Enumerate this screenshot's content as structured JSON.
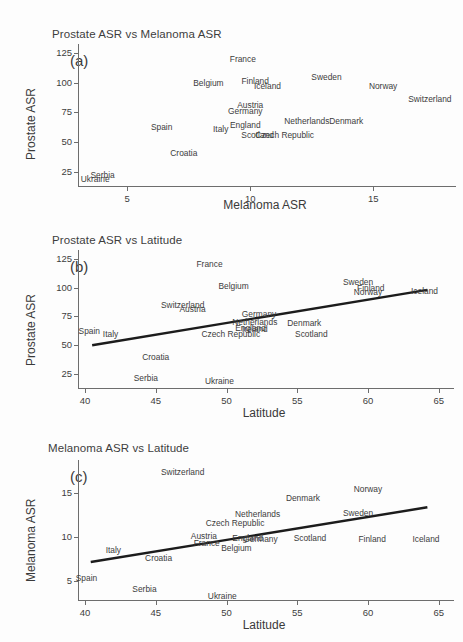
{
  "figure": {
    "background": "#fdfdfd",
    "text_color": "#3c3c3c",
    "line_color": "#1c1c1c"
  },
  "chart_data": [
    {
      "type": "scatter",
      "panel_tag": "(a)",
      "title": "Prostate ASR vs Melanoma ASR",
      "xlabel": "Melanoma ASR",
      "ylabel": "Prostate ASR",
      "xlim": [
        3.0,
        18.2
      ],
      "ylim": [
        13,
        129
      ],
      "xticks": [
        5,
        10,
        15
      ],
      "yticks": [
        25,
        50,
        75,
        100,
        125
      ],
      "grid": false,
      "legend": "none",
      "trendline": null,
      "points": [
        {
          "label": "France",
          "x": 9.7,
          "y": 120
        },
        {
          "label": "Belgium",
          "x": 8.3,
          "y": 100
        },
        {
          "label": "Finland",
          "x": 10.2,
          "y": 101
        },
        {
          "label": "Iceland",
          "x": 10.7,
          "y": 97
        },
        {
          "label": "Sweden",
          "x": 13.1,
          "y": 105
        },
        {
          "label": "Norway",
          "x": 15.4,
          "y": 97
        },
        {
          "label": "Switzerland",
          "x": 17.3,
          "y": 86
        },
        {
          "label": "Austria",
          "x": 10.0,
          "y": 81
        },
        {
          "label": "Germany",
          "x": 9.8,
          "y": 76
        },
        {
          "label": "Netherlands",
          "x": 12.3,
          "y": 68
        },
        {
          "label": "Denmark",
          "x": 13.9,
          "y": 68
        },
        {
          "label": "Spain",
          "x": 6.4,
          "y": 63
        },
        {
          "label": "Italy",
          "x": 8.8,
          "y": 61
        },
        {
          "label": "England",
          "x": 9.8,
          "y": 64
        },
        {
          "label": "Scotland",
          "x": 10.3,
          "y": 56
        },
        {
          "label": "Czech Republic",
          "x": 11.4,
          "y": 56
        },
        {
          "label": "Croatia",
          "x": 7.3,
          "y": 41
        },
        {
          "label": "Serbia",
          "x": 4.0,
          "y": 22
        },
        {
          "label": "Ukraine",
          "x": 3.7,
          "y": 19
        }
      ]
    },
    {
      "type": "scatter",
      "panel_tag": "(b)",
      "title": "Prostate ASR vs Latitude",
      "xlabel": "Latitude",
      "ylabel": "Prostate ASR",
      "xlim": [
        39.5,
        65.8
      ],
      "ylim": [
        13,
        129
      ],
      "xticks": [
        40,
        45,
        50,
        55,
        60,
        65
      ],
      "yticks": [
        25,
        50,
        75,
        100,
        125
      ],
      "grid": false,
      "legend": "none",
      "trendline": {
        "x0": 40.5,
        "y0": 50,
        "x1": 64.2,
        "y1": 98
      },
      "points": [
        {
          "label": "France",
          "x": 48.8,
          "y": 120
        },
        {
          "label": "Belgium",
          "x": 50.5,
          "y": 101
        },
        {
          "label": "Sweden",
          "x": 59.3,
          "y": 105
        },
        {
          "label": "Finland",
          "x": 60.2,
          "y": 100
        },
        {
          "label": "Norway",
          "x": 60.0,
          "y": 96
        },
        {
          "label": "Iceland",
          "x": 64.0,
          "y": 97
        },
        {
          "label": "Switzerland",
          "x": 46.9,
          "y": 85
        },
        {
          "label": "Austria",
          "x": 47.6,
          "y": 81
        },
        {
          "label": "Germany",
          "x": 52.3,
          "y": 77
        },
        {
          "label": "Netherlands",
          "x": 52.0,
          "y": 70
        },
        {
          "label": "England",
          "x": 51.7,
          "y": 65
        },
        {
          "label": "Ireland",
          "x": 52.0,
          "y": 64
        },
        {
          "label": "Denmark",
          "x": 55.5,
          "y": 69
        },
        {
          "label": "Scotland",
          "x": 56.0,
          "y": 60
        },
        {
          "label": "Czech Republic",
          "x": 50.3,
          "y": 60
        },
        {
          "label": "Spain",
          "x": 40.3,
          "y": 62
        },
        {
          "label": "Italy",
          "x": 41.8,
          "y": 60
        },
        {
          "label": "Croatia",
          "x": 45.0,
          "y": 40
        },
        {
          "label": "Serbia",
          "x": 44.3,
          "y": 22
        },
        {
          "label": "Ukraine",
          "x": 49.5,
          "y": 19
        }
      ]
    },
    {
      "type": "scatter",
      "panel_tag": "(c)",
      "title": "Melanoma ASR vs Latitude",
      "xlabel": "Latitude",
      "ylabel": "Melanoma ASR",
      "xlim": [
        39.5,
        65.8
      ],
      "ylim": [
        2.9,
        18.3
      ],
      "xticks": [
        40,
        45,
        50,
        55,
        60,
        65
      ],
      "yticks": [
        5,
        10,
        15
      ],
      "grid": false,
      "legend": "none",
      "trendline": {
        "x0": 40.4,
        "y0": 7.2,
        "x1": 64.2,
        "y1": 13.4
      },
      "points": [
        {
          "label": "Switzerland",
          "x": 46.9,
          "y": 17.4
        },
        {
          "label": "Norway",
          "x": 60.0,
          "y": 15.5
        },
        {
          "label": "Denmark",
          "x": 55.4,
          "y": 14.5
        },
        {
          "label": "Netherlands",
          "x": 52.2,
          "y": 12.6
        },
        {
          "label": "Sweden",
          "x": 59.3,
          "y": 12.7
        },
        {
          "label": "Czech Republic",
          "x": 50.6,
          "y": 11.6
        },
        {
          "label": "Austria",
          "x": 48.4,
          "y": 10.2
        },
        {
          "label": "England",
          "x": 51.5,
          "y": 9.9
        },
        {
          "label": "Germany",
          "x": 52.4,
          "y": 9.8
        },
        {
          "label": "Scotland",
          "x": 55.9,
          "y": 9.9
        },
        {
          "label": "Finland",
          "x": 60.3,
          "y": 9.8
        },
        {
          "label": "Iceland",
          "x": 64.1,
          "y": 9.8
        },
        {
          "label": "France",
          "x": 48.6,
          "y": 9.4
        },
        {
          "label": "Belgium",
          "x": 50.7,
          "y": 8.8
        },
        {
          "label": "Italy",
          "x": 42.0,
          "y": 8.6
        },
        {
          "label": "Croatia",
          "x": 45.2,
          "y": 7.6
        },
        {
          "label": "Spain",
          "x": 40.1,
          "y": 5.4
        },
        {
          "label": "Serbia",
          "x": 44.2,
          "y": 4.1
        },
        {
          "label": "Ukraine",
          "x": 49.7,
          "y": 3.4
        }
      ]
    }
  ]
}
